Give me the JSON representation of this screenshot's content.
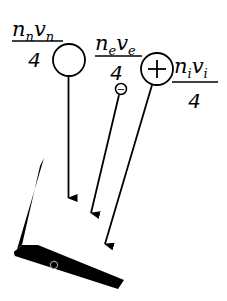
{
  "diagram": {
    "fluxes": [
      {
        "id": "neutral",
        "numerator_base1": "n",
        "numerator_sub1": "n",
        "numerator_base2": "v",
        "numerator_sub2": "n",
        "denominator": "4",
        "particle_symbol": "",
        "particle_label": "neutral"
      },
      {
        "id": "electron",
        "numerator_base1": "n",
        "numerator_sub1": "e",
        "numerator_base2": "v",
        "numerator_sub2": "e",
        "denominator": "4",
        "particle_symbol": "−",
        "particle_label": "electron"
      },
      {
        "id": "ion",
        "numerator_base1": "n",
        "numerator_sub1": "i",
        "numerator_base2": "v",
        "numerator_sub2": "i",
        "denominator": "4",
        "particle_symbol": "+",
        "particle_label": "ion"
      }
    ],
    "surface": {
      "label": "wall",
      "color": "#000000"
    },
    "colors": {
      "stroke": "#000000",
      "background": "#ffffff",
      "probe": "#9a9a9a"
    }
  }
}
